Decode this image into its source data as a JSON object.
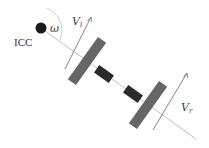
{
  "diagram": {
    "type": "differential-drive-robot-kinematics",
    "labels": {
      "icc": "ICC",
      "omega": "ω",
      "vl_main": "V",
      "vl_sub": "l",
      "vr_main": "V",
      "vr_sub": "r"
    },
    "colors": {
      "background": "#ffffff",
      "icc_dot": "#1a1a1a",
      "axis_line": "#b8b8b8",
      "wheel": "#666666",
      "hub": "#2a2a2a",
      "velocity_arrow": "#777777",
      "omega_arc": "#c8c8c8",
      "text": "#333333"
    },
    "nodes": [
      {
        "id": "icc",
        "label": "ICC",
        "shape": "dot"
      },
      {
        "id": "left-wheel",
        "shape": "rect"
      },
      {
        "id": "right-wheel",
        "shape": "rect"
      },
      {
        "id": "left-hub",
        "shape": "rect"
      },
      {
        "id": "right-hub",
        "shape": "rect"
      }
    ],
    "edges": [
      {
        "from": "icc",
        "to": "right-wheel",
        "style": "line",
        "label": "wheel axis"
      },
      {
        "id": "vl",
        "at": "left-wheel",
        "style": "arrow",
        "label": "V_l"
      },
      {
        "id": "vr",
        "at": "right-wheel",
        "style": "arrow",
        "label": "V_r"
      },
      {
        "id": "omega",
        "at": "icc",
        "style": "arc",
        "label": "ω"
      }
    ]
  }
}
